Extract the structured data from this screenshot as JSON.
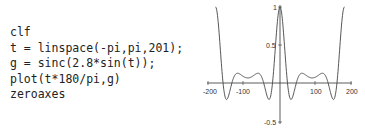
{
  "code": {
    "lines": [
      "clf",
      "t = linspace(-pi,pi,201);",
      "g = sinc(2.8*sin(t));",
      "plot(t*180/pi,g)",
      "zeroaxes"
    ]
  },
  "chart_data": {
    "type": "line",
    "title": "",
    "xlabel": "",
    "ylabel": "",
    "function": "g = sinc(2.8*sin(t)), x = t*180/pi, t in [-pi, pi], 201 points",
    "xlim": [
      -200,
      200
    ],
    "ylim": [
      -0.5,
      1
    ],
    "x_ticks": [
      "-200",
      "-100",
      "100",
      "200"
    ],
    "y_ticks": [
      "1",
      "0.5",
      "-0.5"
    ],
    "axes_style": "zeroaxes",
    "grid": false,
    "legend": null,
    "series": [
      {
        "name": "g",
        "color": "#444444"
      }
    ]
  }
}
